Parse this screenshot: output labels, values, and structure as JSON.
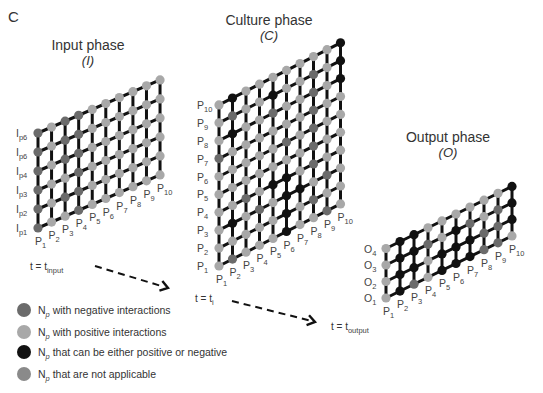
{
  "panel_letter": "C",
  "colors": {
    "negative": "#6b6b6b",
    "positive": "#a8a8a8",
    "either": "#111111",
    "na": "#8a8a8a",
    "edge": "#111111",
    "text": "#333333"
  },
  "phases": [
    {
      "id": "input",
      "title": "Input phase",
      "symbol": "(I)",
      "title_pos": [
        88,
        50
      ],
      "origin": [
        38,
        228
      ],
      "col_step": [
        13.56,
        -5.9
      ],
      "row_step": [
        0,
        -19
      ],
      "cols": 10,
      "rows": 6,
      "row_labels": [
        {
          "main": "I",
          "sub": "p1"
        },
        {
          "main": "I",
          "sub": "p2"
        },
        {
          "main": "I",
          "sub": "p3"
        },
        {
          "main": "I",
          "sub": "p4"
        },
        {
          "main": "I",
          "sub": "p6"
        },
        {
          "main": "I",
          "sub": "p6"
        }
      ],
      "col_labels": [
        {
          "main": "P",
          "sub": "1"
        },
        {
          "main": "P",
          "sub": "2"
        },
        {
          "main": "P",
          "sub": "3"
        },
        {
          "main": "P",
          "sub": "4"
        },
        {
          "main": "P",
          "sub": "5"
        },
        {
          "main": "P",
          "sub": "6"
        },
        {
          "main": "P",
          "sub": "7"
        },
        {
          "main": "P",
          "sub": "8"
        },
        {
          "main": "P",
          "sub": "9"
        },
        {
          "main": "P",
          "sub": "10"
        }
      ],
      "nodes": [
        "nppnpppppp",
        "npnnpppppp",
        "nppnpppppp",
        "npnnpppppp",
        "npnnpppppp",
        "npnnpppppp"
      ]
    },
    {
      "id": "culture",
      "title": "Culture phase",
      "symbol": "(C)",
      "title_pos": [
        269,
        25
      ],
      "origin": [
        219,
        266
      ],
      "col_step": [
        13.5,
        -6.9
      ],
      "row_step": [
        0,
        -17.9
      ],
      "cols": 10,
      "rows": 10,
      "row_labels": [
        {
          "main": "P",
          "sub": "1"
        },
        {
          "main": "P",
          "sub": "2"
        },
        {
          "main": "P",
          "sub": "3"
        },
        {
          "main": "P",
          "sub": "4"
        },
        {
          "main": "P",
          "sub": "5"
        },
        {
          "main": "P",
          "sub": "6"
        },
        {
          "main": "P",
          "sub": "7"
        },
        {
          "main": "P",
          "sub": "8"
        },
        {
          "main": "P",
          "sub": "9"
        },
        {
          "main": "P",
          "sub": "10"
        }
      ],
      "col_labels": [
        {
          "main": "P",
          "sub": "1"
        },
        {
          "main": "P",
          "sub": "2"
        },
        {
          "main": "P",
          "sub": "3"
        },
        {
          "main": "P",
          "sub": "4"
        },
        {
          "main": "P",
          "sub": "5"
        },
        {
          "main": "P",
          "sub": "6"
        },
        {
          "main": "P",
          "sub": "7"
        },
        {
          "main": "P",
          "sub": "8"
        },
        {
          "main": "P",
          "sub": "9"
        },
        {
          "main": "P",
          "sub": "10"
        }
      ],
      "nodes": [
        "pnpppeppnp",
        "pppppepnpp",
        "pepnpeepnp",
        "ppnpeepnpp",
        "pppppppnpp",
        "pppppnpnpp",
        "nppppppnpp",
        "peppnppnpe",
        "pnppeppnpe",
        "pepppppppe"
      ]
    },
    {
      "id": "output",
      "title": "Output phase",
      "symbol": "(O)",
      "title_pos": [
        448,
        142
      ],
      "origin": [
        386,
        298
      ],
      "col_step": [
        14.0,
        -6.9
      ],
      "row_step": [
        0,
        -16.5
      ],
      "cols": 10,
      "rows": 4,
      "row_labels": [
        {
          "main": "O",
          "sub": "1"
        },
        {
          "main": "O",
          "sub": "2"
        },
        {
          "main": "O",
          "sub": "3"
        },
        {
          "main": "O",
          "sub": "4"
        }
      ],
      "col_labels": [
        {
          "main": "P",
          "sub": "1"
        },
        {
          "main": "P",
          "sub": "2"
        },
        {
          "main": "P",
          "sub": "3"
        },
        {
          "main": "P",
          "sub": "4"
        },
        {
          "main": "P",
          "sub": "5"
        },
        {
          "main": "P",
          "sub": "6"
        },
        {
          "main": "P",
          "sub": "7"
        },
        {
          "main": "P",
          "sub": "8"
        },
        {
          "main": "P",
          "sub": "9"
        },
        {
          "main": "P",
          "sub": "10"
        }
      ],
      "nodes": [
        "penpeeennp",
        "peepeeenne",
        "peenpenpne",
        "peeppppppe"
      ]
    }
  ],
  "timeline": [
    {
      "label_main": "t = t",
      "label_sub": "input",
      "label_pos": [
        30,
        270
      ],
      "arrow_from": [
        95,
        266
      ],
      "arrow_to": [
        168,
        288
      ]
    },
    {
      "label_main": "t = t",
      "label_sub": "i",
      "label_pos": [
        195,
        302
      ],
      "arrow_from": [
        232,
        301
      ],
      "arrow_to": [
        315,
        322
      ]
    },
    {
      "label_main": "t = t",
      "label_sub": "output",
      "label_pos": [
        331,
        330
      ]
    }
  ],
  "legend": [
    {
      "key": "negative",
      "main": "N",
      "sub": "p",
      "text": " with negative interactions",
      "y": 314
    },
    {
      "key": "positive",
      "main": "N",
      "sub": "p",
      "text": " with positive interactions",
      "y": 336
    },
    {
      "key": "either",
      "main": "N",
      "sub": "p",
      "text": " that can be either positive or negative",
      "y": 356
    },
    {
      "key": "na",
      "main": "N",
      "sub": "p",
      "text": "  that are not applicable",
      "y": 378
    }
  ]
}
